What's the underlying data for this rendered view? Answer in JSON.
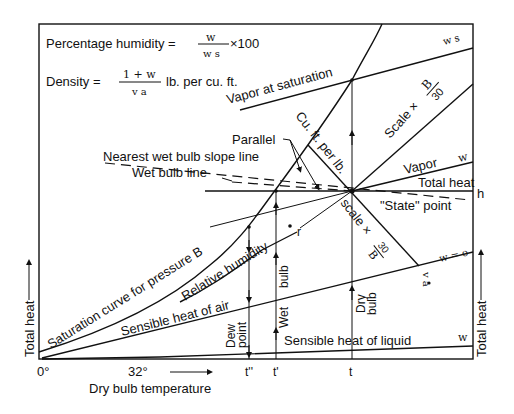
{
  "diagram": {
    "formulas": {
      "humidity_label": "Percentage humidity =",
      "humidity_num": "w",
      "humidity_den": "w s",
      "humidity_tail": "×100",
      "density_label": "Density =",
      "density_num": "1 + w",
      "density_den": "v a",
      "density_tail": "lb. per cu. ft."
    },
    "labels": {
      "vapor_at_saturation": "Vapor at saturation",
      "ws": "w s",
      "cu_ft_per_lb": "Cu. ft. per lb.",
      "scale_b30_upper": "Scale ×",
      "b_over_30_num": "B",
      "b_over_30_den": "30",
      "parallel": "Parallel",
      "nearest_wet_bulb": "Nearest wet bulb slope line",
      "wet_bulb_line": "Wet bulb line",
      "vapor": "Vapor",
      "w_vapor": "w",
      "total_heat": "Total heat",
      "h": "h",
      "state_point": "\"State\" point",
      "scale_30b": "scale ×",
      "thirty_over_b_num": "30",
      "thirty_over_b_den": "B",
      "w_eq_o": "w = o",
      "va": "v a",
      "r": "r",
      "saturation_curve": "Saturation curve for pressure B",
      "relative_humidity": "Relative humidity",
      "sensible_heat_air": "Sensible heat of air",
      "sensible_heat_liquid": "Sensible heat of liquid",
      "w_liquid": "w",
      "dew_point": "Dew point",
      "dew": "Dew",
      "point": "point",
      "wet_bulb_upper": "bulb",
      "wet_bulb_lower": "Wet",
      "dry": "Dry",
      "bulb": "bulb",
      "total_heat_left": "Total heat",
      "total_heat_right": "Total heat"
    },
    "x_axis": {
      "label": "Dry bulb temperature",
      "ticks": [
        "0°",
        "32°",
        "t''",
        "t'",
        "t"
      ]
    }
  }
}
